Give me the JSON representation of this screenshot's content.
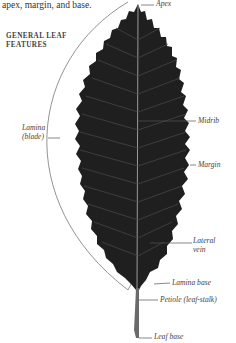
{
  "intro_text": "apex, margin, and base.",
  "heading": {
    "line1": "GENERAL LEAF",
    "line2": "FEATURES"
  },
  "labels": {
    "apex": "Apex",
    "lamina_line1": "Lamina",
    "lamina_line2": "(blade)",
    "midrib": "Midrib",
    "margin": "Margin",
    "lateral_vein_line1": "Lateral",
    "lateral_vein_line2": "vein",
    "lamina_base": "Lamina base",
    "petiole": "Petiole (leaf-stalk)",
    "leaf_base": "Leaf base"
  },
  "colors": {
    "leaf": "#1f1f1f",
    "vein": "#9a9a9a",
    "leader_line": "#555555",
    "text": "#444444"
  }
}
